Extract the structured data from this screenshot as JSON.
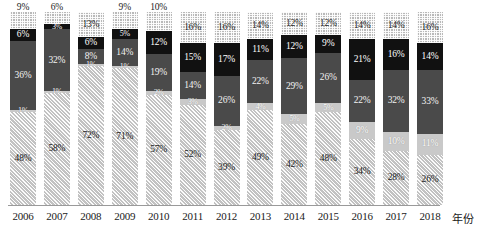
{
  "chart_data": {
    "type": "bar",
    "stacked": true,
    "title": "",
    "subtitle": "",
    "xlabel": "年份",
    "ylabel": "",
    "ylim": [
      0,
      100
    ],
    "grid": false,
    "legend_position": "none",
    "value_suffix": "%",
    "categories": [
      "2006",
      "2007",
      "2008",
      "2009",
      "2010",
      "2011",
      "2012",
      "2013",
      "2014",
      "2015",
      "2016",
      "2017",
      "2018"
    ],
    "series": [
      {
        "name": "series-1-hatched",
        "color": "#c2c2c2",
        "pattern": "diagonal-hatch",
        "values": [
          48,
          58,
          72,
          71,
          57,
          52,
          39,
          49,
          42,
          48,
          34,
          28,
          26
        ],
        "labels": [
          "48%",
          "58%",
          "72%",
          "71%",
          "57%",
          "52%",
          "39%",
          "49%",
          "42%",
          "48%",
          "34%",
          "28%",
          "26%"
        ]
      },
      {
        "name": "series-2-light-gray",
        "color": "#c9c9c9",
        "pattern": "solid",
        "values": [
          1,
          1,
          1,
          1,
          2,
          3,
          2,
          4,
          5,
          5,
          9,
          10,
          11
        ],
        "labels": [
          "1%",
          "1%",
          "1%",
          "1%",
          "2%",
          "3%",
          "2%",
          "4%",
          "5%",
          "5%",
          "9%",
          "10%",
          "11%"
        ]
      },
      {
        "name": "series-3-dark-gray",
        "color": "#4a4a4a",
        "pattern": "solid",
        "values": [
          36,
          32,
          8,
          14,
          19,
          14,
          26,
          22,
          29,
          26,
          22,
          32,
          33
        ],
        "labels": [
          "36%",
          "32%",
          "8%",
          "14%",
          "19%",
          "14%",
          "26%",
          "22%",
          "29%",
          "26%",
          "22%",
          "32%",
          "33%"
        ]
      },
      {
        "name": "series-4-black",
        "color": "#111111",
        "pattern": "solid",
        "values": [
          6,
          3,
          6,
          5,
          12,
          15,
          17,
          11,
          12,
          9,
          21,
          16,
          14
        ],
        "labels": [
          "6%",
          "3%",
          "6%",
          "5%",
          "12%",
          "15%",
          "17%",
          "11%",
          "12%",
          "9%",
          "21%",
          "16%",
          "14%"
        ]
      },
      {
        "name": "series-5-checkered",
        "color": "#b9b9b9",
        "pattern": "checker",
        "values": [
          9,
          6,
          13,
          9,
          10,
          16,
          16,
          14,
          12,
          12,
          14,
          14,
          16
        ],
        "labels": [
          "9%",
          "6%",
          "13%",
          "9%",
          "10%",
          "16%",
          "16%",
          "14%",
          "12%",
          "12%",
          "14%",
          "14%",
          "16%"
        ]
      }
    ]
  }
}
